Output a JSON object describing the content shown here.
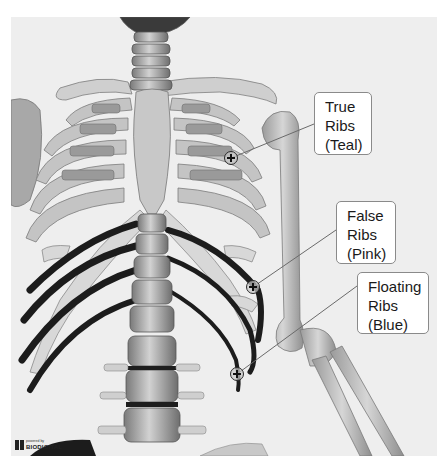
{
  "figure": {
    "background_color": "#eeeeee"
  },
  "callouts": [
    {
      "id": "true-ribs",
      "lines": [
        "True",
        "Ribs",
        "(Teal)"
      ],
      "marker": {
        "x": 231,
        "y": 158
      }
    },
    {
      "id": "false-ribs",
      "lines": [
        "False",
        "Ribs",
        "(Pink)"
      ],
      "marker": {
        "x": 253,
        "y": 287
      }
    },
    {
      "id": "floating-ribs",
      "lines": [
        "Floating",
        "Ribs",
        "(Blue)"
      ],
      "marker": {
        "x": 237,
        "y": 374
      }
    }
  ],
  "logo": {
    "small_text": "powered by",
    "brand_text": "BIODIGITAL"
  }
}
